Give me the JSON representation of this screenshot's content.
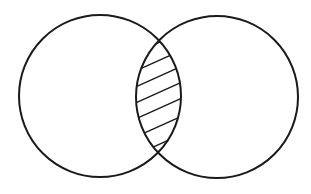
{
  "diagram": {
    "type": "venn",
    "background": "#ffffff",
    "stroke_color": "#1a1a1a",
    "circles": [
      {
        "name": "set-a",
        "cx": 100,
        "cy": 96,
        "r": 81
      },
      {
        "name": "set-b",
        "cx": 217,
        "cy": 97,
        "r": 81
      }
    ],
    "shaded_region": "intersection",
    "hatch": {
      "direction": "lower-left-to-upper-right",
      "line_count": 7
    }
  }
}
